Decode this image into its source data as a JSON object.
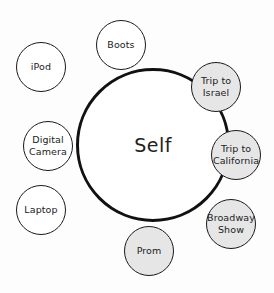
{
  "diagram": {
    "center": {
      "label": "Self",
      "cx": 153,
      "cy": 145,
      "r": 77
    },
    "colors": {
      "stroke": "#111111",
      "attached_fill": "#e6e6e6",
      "detached_fill": "#ffffff",
      "background": "#fdfdfd"
    },
    "nodes": [
      {
        "id": "ipod",
        "label_lines": [
          "iPod"
        ],
        "cx": 41,
        "cy": 67,
        "r": 25,
        "attached": false
      },
      {
        "id": "boots",
        "label_lines": [
          "Boots"
        ],
        "cx": 121,
        "cy": 45,
        "r": 25,
        "attached": false
      },
      {
        "id": "trip-israel",
        "label_lines": [
          "Trip to",
          "Israel"
        ],
        "cx": 216,
        "cy": 87,
        "r": 25,
        "attached": true
      },
      {
        "id": "digital-camera",
        "label_lines": [
          "Digital",
          "Camera"
        ],
        "cx": 48,
        "cy": 146,
        "r": 25,
        "attached": false
      },
      {
        "id": "trip-california",
        "label_lines": [
          "Trip to",
          "California"
        ],
        "cx": 236,
        "cy": 155,
        "r": 25,
        "attached": true
      },
      {
        "id": "laptop",
        "label_lines": [
          "Laptop"
        ],
        "cx": 41,
        "cy": 210,
        "r": 25,
        "attached": false
      },
      {
        "id": "broadway-show",
        "label_lines": [
          "Broadway",
          "Show"
        ],
        "cx": 231,
        "cy": 224,
        "r": 25,
        "attached": false
      },
      {
        "id": "prom",
        "label_lines": [
          "Prom"
        ],
        "cx": 149,
        "cy": 251,
        "r": 25,
        "attached": true
      }
    ]
  }
}
